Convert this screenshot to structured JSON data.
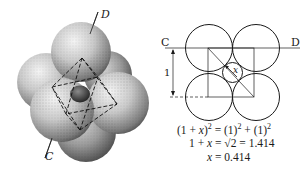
{
  "left_figure": {
    "description": "Octahedral hole formed by six close-packed spheres with a small interstitial sphere",
    "axis_labels": {
      "top": "D",
      "bottom": "C"
    }
  },
  "right_figure": {
    "description": "Cross-section through octahedral hole showing four spheres and interstitial sphere",
    "axis_labels": {
      "left": "C",
      "right": "D"
    },
    "dimension_label": "1",
    "radius_label": "x"
  },
  "equations": {
    "line1_lhs": "(1 + ",
    "line1_x": "x",
    "line1_mid": ")",
    "line1_exp1": "2",
    "line1_eq": " = (1)",
    "line1_exp2": "2",
    "line1_plus": " + (1)",
    "line1_exp3": "2",
    "line2_lhs": "1 + ",
    "line2_x": "x",
    "line2_rhs": " = √2 = 1.414",
    "line3_x": "x",
    "line3_rhs": " = 0.414"
  },
  "colors": {
    "ink": "#1a1a1a",
    "sphere_light": "#e6e6e6",
    "sphere_dark": "#5a5a5a",
    "background": "#ffffff"
  }
}
